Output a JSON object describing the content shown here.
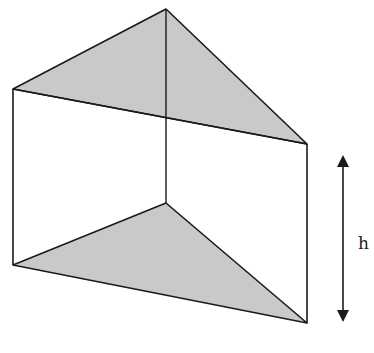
{
  "diagram": {
    "labels": {
      "height": "h"
    },
    "colors": {
      "face_fill": "#c9c9c9",
      "edge": "#1a1a1a",
      "background": "#ffffff"
    },
    "vertices": {
      "top_apex": [
        166,
        9
      ],
      "top_left": [
        13,
        89
      ],
      "top_right": [
        307,
        144
      ],
      "bottom_apex": [
        166,
        203
      ],
      "bottom_left": [
        13,
        265
      ],
      "bottom_right": [
        307,
        323
      ]
    },
    "height_arrow": {
      "x": 343,
      "y_top": 155,
      "y_bottom": 322
    }
  }
}
